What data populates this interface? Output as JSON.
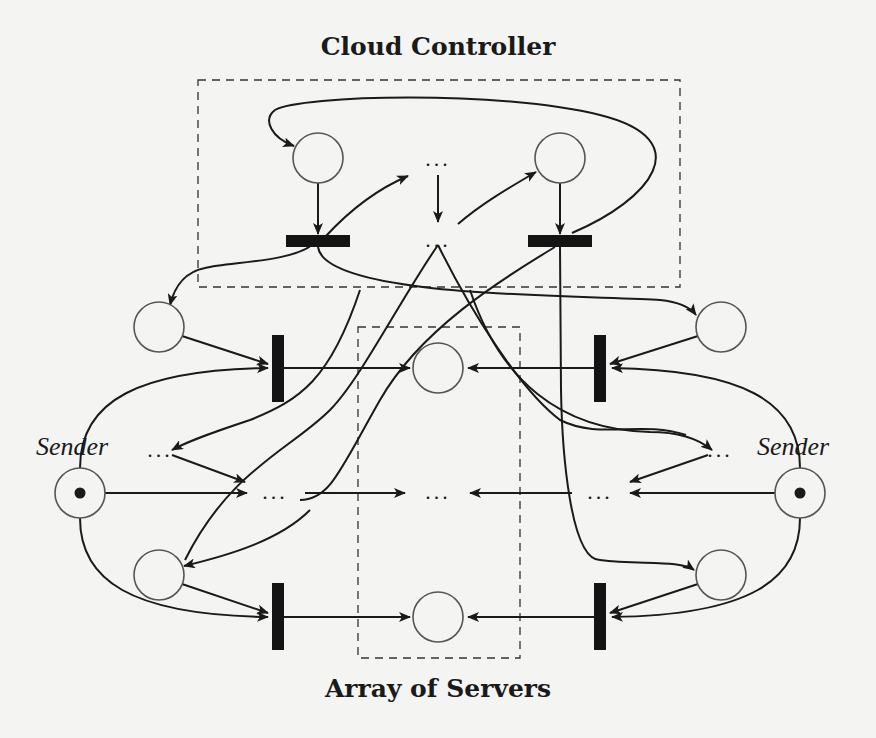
{
  "diagram": {
    "title_top": "Cloud Controller",
    "title_bottom": "Array of Servers",
    "sender_left": "Sender",
    "sender_right": "Sender",
    "ellipsis": "...",
    "colors": {
      "background": "#f4f4f2",
      "ink": "#1a1a1a",
      "place_stroke": "#555555"
    },
    "groups": [
      {
        "name": "Cloud Controller",
        "type": "dashed-box"
      },
      {
        "name": "Array of Servers",
        "type": "dashed-box"
      }
    ],
    "places": [
      {
        "id": "controller-left",
        "marked": false
      },
      {
        "id": "controller-right",
        "marked": false
      },
      {
        "id": "server-top",
        "marked": false
      },
      {
        "id": "server-bottom",
        "marked": false
      },
      {
        "id": "left-upper",
        "marked": false
      },
      {
        "id": "left-lower",
        "marked": false
      },
      {
        "id": "right-upper",
        "marked": false
      },
      {
        "id": "right-lower",
        "marked": false
      },
      {
        "id": "sender-left",
        "marked": true
      },
      {
        "id": "sender-right",
        "marked": true
      }
    ],
    "transitions": [
      {
        "id": "controller-left",
        "orientation": "horizontal"
      },
      {
        "id": "controller-right",
        "orientation": "horizontal"
      },
      {
        "id": "left-upper",
        "orientation": "vertical"
      },
      {
        "id": "left-lower",
        "orientation": "vertical"
      },
      {
        "id": "right-upper",
        "orientation": "vertical"
      },
      {
        "id": "right-lower",
        "orientation": "vertical"
      }
    ]
  }
}
